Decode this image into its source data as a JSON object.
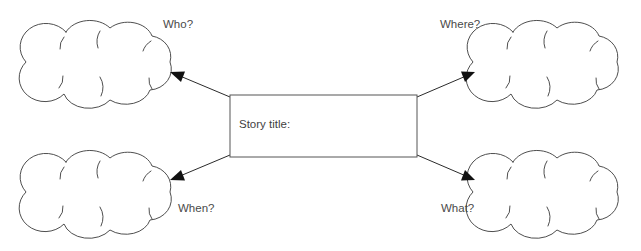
{
  "canvas": {
    "width": 641,
    "height": 251,
    "background": "#ffffff"
  },
  "diagram": {
    "type": "story-map",
    "title_hint": "Story elements graphic organizer"
  },
  "center_box": {
    "label": "Story title:",
    "value": "",
    "placeholder": "",
    "x": 230,
    "y": 95,
    "width": 187,
    "height": 62,
    "border_color": "#555555",
    "fill_color": "#ffffff"
  },
  "clouds": [
    {
      "id": "who",
      "label": "Who?",
      "value": "",
      "position": "top-left",
      "cx": 98,
      "cy": 62,
      "rx": 74,
      "ry": 48
    },
    {
      "id": "where",
      "label": "Where?",
      "value": "",
      "position": "top-right",
      "cx": 545,
      "cy": 62,
      "rx": 74,
      "ry": 48
    },
    {
      "id": "when",
      "label": "When?",
      "value": "",
      "position": "bottom-left",
      "cx": 98,
      "cy": 192,
      "rx": 74,
      "ry": 48
    },
    {
      "id": "what",
      "label": "What?",
      "value": "",
      "position": "bottom-right",
      "cx": 545,
      "cy": 192,
      "rx": 74,
      "ry": 48
    }
  ],
  "connectors": [
    {
      "id": "to-who",
      "from": "center_box",
      "to": "who",
      "arrow": "single",
      "color": "#2b2b2b"
    },
    {
      "id": "to-where",
      "from": "center_box",
      "to": "where",
      "arrow": "single",
      "color": "#2b2b2b"
    },
    {
      "id": "to-when",
      "from": "center_box",
      "to": "when",
      "arrow": "single",
      "color": "#2b2b2b"
    },
    {
      "id": "to-what",
      "from": "center_box",
      "to": "what",
      "arrow": "single",
      "color": "#2b2b2b"
    }
  ],
  "colors": {
    "stroke": "#3a3a3a",
    "text": "#4a4a4a",
    "arrow": "#111111",
    "background": "#ffffff"
  }
}
